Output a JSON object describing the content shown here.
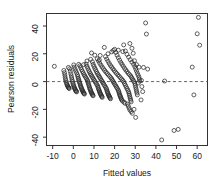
{
  "chart_data": {
    "type": "scatter",
    "title": "",
    "xlabel": "Fitted values",
    "ylabel": "Pearson residuals",
    "xlim": [
      -13,
      65
    ],
    "ylim": [
      -46,
      49
    ],
    "xticks": [
      -10,
      0,
      10,
      20,
      30,
      40,
      50,
      60
    ],
    "xtick_labels": [
      "-10",
      "0",
      "10",
      "20",
      "30",
      "40",
      "50",
      "60"
    ],
    "yticks": [
      -40,
      -20,
      0,
      20,
      40
    ],
    "ytick_labels": [
      "-40",
      "-20",
      "0",
      "20",
      "40"
    ],
    "grid": false,
    "legend": null,
    "marker": "open-circle",
    "marker_color": "#2b2b2b",
    "marker_radius": 2.0,
    "reference_line": {
      "orientation": "horizontal",
      "y": 0,
      "style": "dashed",
      "color": "#555555"
    },
    "points": [
      [
        -9.2,
        11.0
      ],
      [
        -4.6,
        8.0
      ],
      [
        -4.3,
        6.4
      ],
      [
        -4.1,
        4.8
      ],
      [
        -4.0,
        3.2
      ],
      [
        -3.8,
        1.8
      ],
      [
        -3.6,
        0.6
      ],
      [
        -3.4,
        -0.6
      ],
      [
        -3.2,
        -1.6
      ],
      [
        -3.0,
        -2.4
      ],
      [
        -2.8,
        -3.0
      ],
      [
        -2.6,
        -3.6
      ],
      [
        -2.4,
        -4.2
      ],
      [
        -2.2,
        -4.6
      ],
      [
        -2.0,
        -5.0
      ],
      [
        -1.8,
        9.2
      ],
      [
        -1.5,
        7.4
      ],
      [
        -1.2,
        5.6
      ],
      [
        -1.0,
        4.0
      ],
      [
        -0.8,
        2.6
      ],
      [
        -0.6,
        1.2
      ],
      [
        -0.4,
        0.0
      ],
      [
        -0.2,
        -1.2
      ],
      [
        0.0,
        -2.2
      ],
      [
        0.2,
        -3.2
      ],
      [
        0.4,
        -4.0
      ],
      [
        0.6,
        -4.8
      ],
      [
        0.8,
        -5.4
      ],
      [
        1.0,
        -6.0
      ],
      [
        1.2,
        -6.6
      ],
      [
        1.4,
        -7.0
      ],
      [
        1.6,
        -7.4
      ],
      [
        0.4,
        10.4
      ],
      [
        0.8,
        9.0
      ],
      [
        1.2,
        7.6
      ],
      [
        1.6,
        6.2
      ],
      [
        2.0,
        4.8
      ],
      [
        2.2,
        3.6
      ],
      [
        2.4,
        2.4
      ],
      [
        2.6,
        1.4
      ],
      [
        2.8,
        0.4
      ],
      [
        3.0,
        -0.6
      ],
      [
        3.2,
        -1.6
      ],
      [
        3.4,
        -2.6
      ],
      [
        3.6,
        -3.4
      ],
      [
        3.8,
        -4.2
      ],
      [
        4.0,
        -5.0
      ],
      [
        4.2,
        -5.8
      ],
      [
        4.4,
        -6.4
      ],
      [
        4.6,
        -7.0
      ],
      [
        4.8,
        -7.6
      ],
      [
        5.0,
        -8.2
      ],
      [
        5.2,
        -8.6
      ],
      [
        5.4,
        -9.0
      ],
      [
        3.2,
        11.4
      ],
      [
        3.6,
        10.0
      ],
      [
        4.0,
        8.6
      ],
      [
        4.4,
        7.4
      ],
      [
        4.8,
        6.2
      ],
      [
        5.2,
        5.0
      ],
      [
        5.6,
        4.0
      ],
      [
        6.0,
        3.0
      ],
      [
        6.4,
        2.0
      ],
      [
        6.8,
        1.0
      ],
      [
        7.0,
        0.0
      ],
      [
        7.2,
        -1.0
      ],
      [
        7.4,
        -2.0
      ],
      [
        7.6,
        -3.0
      ],
      [
        7.8,
        -4.0
      ],
      [
        8.0,
        -5.0
      ],
      [
        8.2,
        -5.8
      ],
      [
        8.4,
        -6.6
      ],
      [
        8.6,
        -7.4
      ],
      [
        8.8,
        -8.0
      ],
      [
        9.0,
        -8.6
      ],
      [
        9.2,
        -9.2
      ],
      [
        9.4,
        -9.8
      ],
      [
        9.6,
        -10.2
      ],
      [
        6.2,
        12.6
      ],
      [
        6.6,
        11.0
      ],
      [
        7.0,
        9.6
      ],
      [
        7.4,
        8.2
      ],
      [
        7.8,
        7.0
      ],
      [
        8.2,
        5.8
      ],
      [
        8.6,
        4.8
      ],
      [
        9.0,
        3.8
      ],
      [
        9.4,
        2.8
      ],
      [
        9.8,
        1.8
      ],
      [
        10.2,
        0.8
      ],
      [
        10.6,
        -0.2
      ],
      [
        11.0,
        -1.2
      ],
      [
        11.4,
        -2.2
      ],
      [
        11.8,
        -3.2
      ],
      [
        12.0,
        -4.2
      ],
      [
        12.2,
        -5.2
      ],
      [
        12.4,
        -6.0
      ],
      [
        12.6,
        -6.8
      ],
      [
        12.8,
        -7.6
      ],
      [
        13.0,
        -8.4
      ],
      [
        13.2,
        -9.0
      ],
      [
        13.4,
        -9.6
      ],
      [
        13.6,
        -10.2
      ],
      [
        13.8,
        -10.8
      ],
      [
        14.0,
        -11.4
      ],
      [
        8.8,
        20.6
      ],
      [
        9.2,
        14.2
      ],
      [
        9.6,
        12.4
      ],
      [
        10.0,
        11.0
      ],
      [
        10.4,
        9.6
      ],
      [
        10.8,
        8.4
      ],
      [
        11.2,
        7.2
      ],
      [
        11.6,
        6.0
      ],
      [
        12.0,
        5.0
      ],
      [
        12.4,
        4.0
      ],
      [
        12.8,
        3.0
      ],
      [
        13.2,
        2.0
      ],
      [
        13.6,
        1.0
      ],
      [
        14.0,
        0.0
      ],
      [
        14.4,
        -1.0
      ],
      [
        14.8,
        -2.0
      ],
      [
        15.2,
        -3.0
      ],
      [
        15.6,
        -4.0
      ],
      [
        16.0,
        -5.0
      ],
      [
        16.2,
        -6.0
      ],
      [
        16.4,
        -7.0
      ],
      [
        16.6,
        -7.8
      ],
      [
        16.8,
        -8.6
      ],
      [
        17.0,
        -9.4
      ],
      [
        17.2,
        -10.0
      ],
      [
        17.4,
        -10.6
      ],
      [
        17.6,
        -11.2
      ],
      [
        17.8,
        -11.8
      ],
      [
        18.0,
        -12.4
      ],
      [
        11.6,
        16.4
      ],
      [
        12.2,
        14.8
      ],
      [
        12.8,
        13.2
      ],
      [
        13.4,
        11.8
      ],
      [
        14.0,
        10.4
      ],
      [
        14.6,
        9.2
      ],
      [
        15.2,
        8.0
      ],
      [
        15.8,
        6.8
      ],
      [
        16.4,
        5.8
      ],
      [
        17.0,
        4.8
      ],
      [
        17.6,
        3.8
      ],
      [
        18.2,
        2.8
      ],
      [
        18.6,
        1.8
      ],
      [
        19.0,
        0.8
      ],
      [
        19.4,
        -0.2
      ],
      [
        19.8,
        -1.2
      ],
      [
        20.2,
        -2.2
      ],
      [
        20.6,
        -3.2
      ],
      [
        21.0,
        -4.2
      ],
      [
        21.4,
        -5.2
      ],
      [
        21.8,
        -6.2
      ],
      [
        22.0,
        -7.2
      ],
      [
        22.2,
        -8.2
      ],
      [
        22.4,
        -9.2
      ],
      [
        22.6,
        -10.0
      ],
      [
        22.8,
        -10.8
      ],
      [
        23.0,
        -11.6
      ],
      [
        23.2,
        -12.4
      ],
      [
        23.4,
        -13.0
      ],
      [
        15.0,
        24.6
      ],
      [
        15.6,
        18.0
      ],
      [
        16.2,
        16.2
      ],
      [
        16.8,
        14.6
      ],
      [
        17.4,
        13.0
      ],
      [
        18.0,
        11.6
      ],
      [
        18.6,
        10.4
      ],
      [
        19.2,
        9.2
      ],
      [
        19.8,
        8.0
      ],
      [
        20.4,
        6.8
      ],
      [
        21.0,
        5.8
      ],
      [
        21.6,
        4.8
      ],
      [
        22.2,
        3.8
      ],
      [
        22.8,
        2.8
      ],
      [
        23.4,
        1.8
      ],
      [
        24.0,
        0.8
      ],
      [
        24.4,
        -0.2
      ],
      [
        24.8,
        -1.4
      ],
      [
        25.2,
        -2.6
      ],
      [
        25.6,
        -3.8
      ],
      [
        26.0,
        -5.0
      ],
      [
        26.4,
        -6.2
      ],
      [
        26.8,
        -7.4
      ],
      [
        27.0,
        -8.6
      ],
      [
        27.2,
        -9.8
      ],
      [
        27.4,
        -11.0
      ],
      [
        27.6,
        -12.2
      ],
      [
        27.8,
        -13.4
      ],
      [
        28.0,
        -14.6
      ],
      [
        20.0,
        23.2
      ],
      [
        20.6,
        21.0
      ],
      [
        21.2,
        19.0
      ],
      [
        21.8,
        17.2
      ],
      [
        22.4,
        15.4
      ],
      [
        23.0,
        13.8
      ],
      [
        23.6,
        12.4
      ],
      [
        24.2,
        11.0
      ],
      [
        24.8,
        9.6
      ],
      [
        25.4,
        8.4
      ],
      [
        26.0,
        7.2
      ],
      [
        26.6,
        6.0
      ],
      [
        27.2,
        5.0
      ],
      [
        27.8,
        4.0
      ],
      [
        28.2,
        3.0
      ],
      [
        28.6,
        2.0
      ],
      [
        29.0,
        1.0
      ],
      [
        29.4,
        0.0
      ],
      [
        29.8,
        -1.2
      ],
      [
        30.0,
        -2.6
      ],
      [
        30.2,
        -4.0
      ],
      [
        30.4,
        -5.4
      ],
      [
        30.6,
        -6.8
      ],
      [
        30.8,
        -8.2
      ],
      [
        31.0,
        -9.6
      ],
      [
        24.4,
        26.4
      ],
      [
        25.2,
        22.0
      ],
      [
        26.0,
        19.6
      ],
      [
        26.8,
        17.6
      ],
      [
        27.6,
        15.8
      ],
      [
        28.4,
        14.0
      ],
      [
        29.2,
        12.4
      ],
      [
        29.8,
        10.8
      ],
      [
        30.2,
        9.2
      ],
      [
        30.6,
        7.6
      ],
      [
        31.0,
        6.0
      ],
      [
        31.4,
        4.6
      ],
      [
        31.8,
        3.2
      ],
      [
        32.0,
        1.8
      ],
      [
        32.2,
        0.4
      ],
      [
        27.4,
        27.4
      ],
      [
        28.4,
        24.0
      ],
      [
        29.0,
        20.4
      ],
      [
        31.8,
        10.4
      ],
      [
        26.2,
        -16.2
      ],
      [
        26.6,
        -17.6
      ],
      [
        27.0,
        -19.0
      ],
      [
        27.4,
        -20.4
      ],
      [
        28.0,
        -21.6
      ],
      [
        28.6,
        -22.8
      ],
      [
        29.4,
        -20.0
      ],
      [
        30.2,
        -25.8
      ],
      [
        24.6,
        -14.8
      ],
      [
        25.0,
        -15.6
      ],
      [
        23.8,
        -14.0
      ],
      [
        18.6,
        21.4
      ],
      [
        13.0,
        18.8
      ],
      [
        10.4,
        19.0
      ],
      [
        6.6,
        14.8
      ],
      [
        5.0,
        12.2
      ],
      [
        2.6,
        12.4
      ],
      [
        0.2,
        12.0
      ],
      [
        -2.4,
        10.2
      ],
      [
        34.0,
        10.2
      ],
      [
        36.0,
        9.0
      ],
      [
        33.2,
        -3.6
      ],
      [
        33.6,
        -7.2
      ],
      [
        32.8,
        -13.2
      ],
      [
        35.0,
        42.2
      ],
      [
        35.4,
        34.2
      ],
      [
        57.6,
        10.4
      ],
      [
        58.4,
        -9.6
      ],
      [
        60.6,
        46.2
      ],
      [
        60.0,
        34.4
      ],
      [
        61.2,
        26.2
      ],
      [
        42.8,
        -42.0
      ],
      [
        48.8,
        -35.2
      ],
      [
        50.8,
        -34.4
      ],
      [
        44.2,
        0.4
      ],
      [
        33.0,
        0.8
      ],
      [
        31.4,
        -1.0
      ],
      [
        19.4,
        22.4
      ],
      [
        12.6,
        15.6
      ],
      [
        8.4,
        16.0
      ],
      [
        16.8,
        20.0
      ],
      [
        21.8,
        22.6
      ],
      [
        24.0,
        21.6
      ],
      [
        30.6,
        12.2
      ],
      [
        29.6,
        15.0
      ]
    ]
  }
}
